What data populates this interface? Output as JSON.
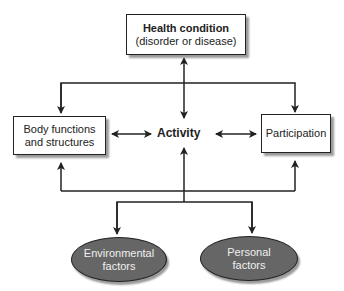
{
  "diagram": {
    "nodes": {
      "health_condition": {
        "line1": "Health condition",
        "line2": "(disorder or disease)"
      },
      "body_functions": {
        "line1": "Body functions",
        "line2": "and structures"
      },
      "activity": {
        "label": "Activity"
      },
      "participation": {
        "label": "Participation"
      },
      "environmental": {
        "line1": "Environmental",
        "line2": "factors"
      },
      "personal": {
        "line1": "Personal",
        "line2": "factors"
      }
    },
    "edges": [
      {
        "from": "health_condition",
        "to": "activity",
        "type": "bidirectional"
      },
      {
        "from": "health_condition",
        "to": "body_functions",
        "type": "directed"
      },
      {
        "from": "health_condition",
        "to": "participation",
        "type": "directed"
      },
      {
        "from": "body_functions",
        "to": "activity",
        "type": "bidirectional"
      },
      {
        "from": "activity",
        "to": "participation",
        "type": "bidirectional"
      },
      {
        "from": "contextual_factors",
        "to": "body_functions",
        "type": "directed"
      },
      {
        "from": "contextual_factors",
        "to": "activity",
        "type": "directed"
      },
      {
        "from": "contextual_factors",
        "to": "participation",
        "type": "directed"
      },
      {
        "from": "activity",
        "to": "environmental",
        "type": "directed"
      },
      {
        "from": "activity",
        "to": "personal",
        "type": "directed"
      }
    ],
    "colors": {
      "line": "#222222",
      "oval_fill": "#666666",
      "oval_text": "#f0f0f0",
      "shadow": "#9a9a9a"
    }
  }
}
